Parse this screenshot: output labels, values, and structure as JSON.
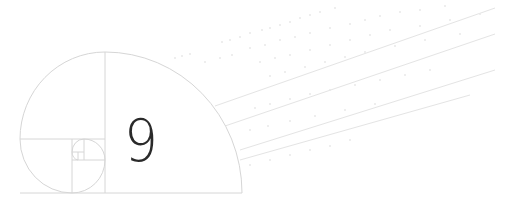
{
  "illustration": {
    "number_label": "9",
    "colors": {
      "line": "#d6d6d6",
      "faint": "#e6e6e6",
      "digit": "#2a2a2a",
      "background": "#ffffff"
    }
  }
}
